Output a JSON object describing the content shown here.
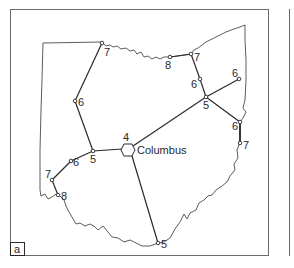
{
  "figure": {
    "panel_label": "a",
    "colors": {
      "line": "#2a2a2a",
      "outline": "#4a4a4a",
      "frame": "#6a6a6a",
      "background": "#ffffff"
    }
  },
  "map": {
    "region": "Ohio",
    "hub": {
      "name": "Columbus",
      "value": "4",
      "x": 128,
      "y": 150
    },
    "nodes": [
      {
        "id": "nw-top",
        "value": "7",
        "x": 102,
        "y": 43
      },
      {
        "id": "west-mid",
        "value": "6",
        "x": 75,
        "y": 101
      },
      {
        "id": "west-junction",
        "value": "5",
        "x": 93,
        "y": 151
      },
      {
        "id": "sw-1",
        "value": "6",
        "x": 71,
        "y": 161
      },
      {
        "id": "sw-2",
        "value": "7",
        "x": 52,
        "y": 180
      },
      {
        "id": "sw-3",
        "value": "8",
        "x": 58,
        "y": 195
      },
      {
        "id": "south",
        "value": "5",
        "x": 158,
        "y": 243
      },
      {
        "id": "north-8",
        "value": "8",
        "x": 170,
        "y": 57
      },
      {
        "id": "north-7",
        "value": "7",
        "x": 191,
        "y": 54
      },
      {
        "id": "ne-6",
        "value": "6",
        "x": 200,
        "y": 79
      },
      {
        "id": "ne-junction",
        "value": "5",
        "x": 206,
        "y": 97
      },
      {
        "id": "east-6-top",
        "value": "6",
        "x": 239,
        "y": 79
      },
      {
        "id": "east-6",
        "value": "6",
        "x": 240,
        "y": 122
      },
      {
        "id": "east-7",
        "value": "7",
        "x": 240,
        "y": 143
      }
    ]
  }
}
